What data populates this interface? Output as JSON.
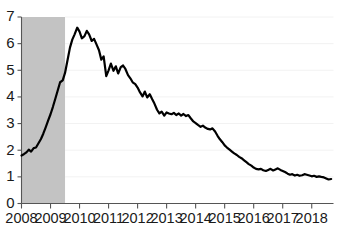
{
  "chart_data": {
    "type": "line",
    "title": "",
    "subtitle": "",
    "xlabel": "",
    "ylabel": "",
    "xlim": [
      2008.0,
      2018.75
    ],
    "ylim": [
      0,
      7
    ],
    "grid": true,
    "grid_axis": "y",
    "legend": "none",
    "line_color": "#000000",
    "line_width": 2.2,
    "recession_band": {
      "label": "recession",
      "color": "#c3c3c3",
      "start": 2008.0,
      "end": 2009.5
    },
    "yticks": [
      0,
      1,
      2,
      3,
      4,
      5,
      6,
      7
    ],
    "ytick_labels": [
      "0",
      "1",
      "2",
      "3",
      "4",
      "5",
      "6",
      "7"
    ],
    "xticks": [
      2008,
      2009,
      2010,
      2011,
      2012,
      2013,
      2014,
      2015,
      2016,
      2017,
      2018
    ],
    "xtick_labels": [
      "2008",
      "2009",
      "2010",
      "2011",
      "2012",
      "2013",
      "2014",
      "2015",
      "2016",
      "2017",
      "2018"
    ],
    "series": [
      {
        "name": "rate",
        "color": "#000000",
        "x": [
          2008.0,
          2008.08,
          2008.17,
          2008.25,
          2008.33,
          2008.42,
          2008.5,
          2008.58,
          2008.67,
          2008.75,
          2008.83,
          2008.92,
          2009.0,
          2009.08,
          2009.17,
          2009.25,
          2009.33,
          2009.42,
          2009.5,
          2009.58,
          2009.67,
          2009.75,
          2009.83,
          2009.92,
          2010.0,
          2010.08,
          2010.17,
          2010.25,
          2010.33,
          2010.42,
          2010.5,
          2010.58,
          2010.67,
          2010.75,
          2010.83,
          2010.92,
          2011.0,
          2011.08,
          2011.17,
          2011.25,
          2011.33,
          2011.42,
          2011.5,
          2011.58,
          2011.67,
          2011.75,
          2011.83,
          2011.92,
          2012.0,
          2012.08,
          2012.17,
          2012.25,
          2012.33,
          2012.42,
          2012.5,
          2012.58,
          2012.67,
          2012.75,
          2012.83,
          2012.92,
          2013.0,
          2013.08,
          2013.17,
          2013.25,
          2013.33,
          2013.42,
          2013.5,
          2013.58,
          2013.67,
          2013.75,
          2013.83,
          2013.92,
          2014.0,
          2014.08,
          2014.17,
          2014.25,
          2014.33,
          2014.42,
          2014.5,
          2014.58,
          2014.67,
          2014.75,
          2014.83,
          2014.92,
          2015.0,
          2015.08,
          2015.17,
          2015.25,
          2015.33,
          2015.42,
          2015.5,
          2015.58,
          2015.67,
          2015.75,
          2015.83,
          2015.92,
          2016.0,
          2016.08,
          2016.17,
          2016.25,
          2016.33,
          2016.42,
          2016.5,
          2016.58,
          2016.67,
          2016.75,
          2016.83,
          2016.92,
          2017.0,
          2017.08,
          2017.17,
          2017.25,
          2017.33,
          2017.42,
          2017.5,
          2017.58,
          2017.67,
          2017.75,
          2017.83,
          2017.92,
          2018.0,
          2018.08,
          2018.17,
          2018.25,
          2018.33,
          2018.42,
          2018.5,
          2018.58,
          2018.67
        ],
        "values": [
          1.8,
          1.85,
          1.92,
          2.02,
          1.95,
          2.08,
          2.1,
          2.25,
          2.42,
          2.62,
          2.85,
          3.12,
          3.35,
          3.62,
          3.95,
          4.25,
          4.55,
          4.62,
          4.9,
          5.35,
          5.85,
          6.15,
          6.35,
          6.6,
          6.45,
          6.2,
          6.28,
          6.48,
          6.35,
          6.1,
          6.18,
          5.98,
          5.75,
          5.4,
          5.52,
          4.78,
          5.0,
          5.25,
          4.98,
          5.15,
          4.88,
          5.12,
          5.18,
          5.05,
          4.82,
          4.7,
          4.55,
          4.48,
          4.35,
          4.18,
          4.02,
          4.2,
          3.98,
          4.1,
          3.92,
          3.75,
          3.52,
          3.38,
          3.45,
          3.3,
          3.42,
          3.38,
          3.35,
          3.4,
          3.32,
          3.38,
          3.3,
          3.36,
          3.28,
          3.32,
          3.2,
          3.08,
          3.02,
          2.95,
          2.88,
          2.92,
          2.85,
          2.8,
          2.78,
          2.82,
          2.7,
          2.55,
          2.42,
          2.3,
          2.18,
          2.1,
          2.02,
          1.95,
          1.88,
          1.82,
          1.75,
          1.7,
          1.62,
          1.55,
          1.48,
          1.42,
          1.35,
          1.3,
          1.28,
          1.3,
          1.25,
          1.22,
          1.26,
          1.3,
          1.24,
          1.28,
          1.32,
          1.26,
          1.22,
          1.18,
          1.12,
          1.08,
          1.1,
          1.05,
          1.08,
          1.04,
          1.06,
          1.1,
          1.08,
          1.05,
          1.02,
          1.04,
          1.0,
          1.02,
          1.0,
          0.98,
          0.94,
          0.9,
          0.92
        ]
      }
    ]
  }
}
